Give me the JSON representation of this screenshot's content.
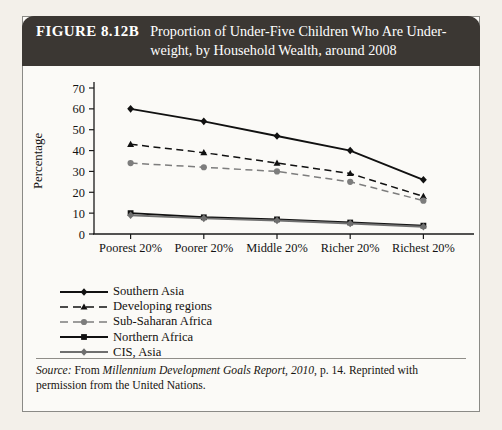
{
  "figure": {
    "number_label": "FIGURE 8.12B",
    "title_line1": "Proportion of Under-Five Children Who Are Under-",
    "title_line2": "weight, by Household Wealth, around 2008"
  },
  "source": {
    "prefix": "Source:",
    "text_before_italic": " From ",
    "italic_title": "Millennium Development Goals Report, 2010",
    "text_after_italic": ", p. 14. Reprinted with permission from the United Nations."
  },
  "colors": {
    "page_background": "#f3f0ea",
    "card_background": "#fbfaf7",
    "banner": "#3b3733",
    "banner_text": "#ffffff",
    "axis": "#1a1a1a",
    "series_dark": "#111111",
    "series_gray": "#7d7d7d",
    "frame_border": "#8a8a86"
  },
  "chart_data": {
    "type": "line",
    "xlabel": "",
    "ylabel": "Percentage",
    "categories": [
      "Poorest 20%",
      "Poorer 20%",
      "Middle 20%",
      "Richer 20%",
      "Richest 20%"
    ],
    "ylim": [
      0,
      70
    ],
    "yticks": [
      0,
      10,
      20,
      30,
      40,
      50,
      60,
      70
    ],
    "ytick_labels": [
      "0",
      "10",
      "20",
      "30",
      "40",
      "50",
      "60",
      "70"
    ],
    "grid": false,
    "legend_position": "below-left",
    "series": [
      {
        "name": "Southern Asia",
        "values": [
          60,
          54,
          47,
          40,
          26
        ],
        "marker": "diamond",
        "line_style": "solid",
        "color": "#111111"
      },
      {
        "name": "Developing regions",
        "values": [
          43,
          39,
          34,
          29,
          18
        ],
        "marker": "triangle",
        "line_style": "dashed",
        "color": "#111111"
      },
      {
        "name": "Sub-Saharan Africa",
        "values": [
          34,
          32,
          30,
          25,
          16
        ],
        "marker": "circle",
        "line_style": "dashed",
        "color": "#7d7d7d"
      },
      {
        "name": "Northern Africa",
        "values": [
          10,
          8,
          7,
          5.5,
          4
        ],
        "marker": "square",
        "line_style": "solid",
        "color": "#111111"
      },
      {
        "name": "CIS, Asia",
        "values": [
          9,
          7.5,
          6.5,
          5,
          3.5
        ],
        "marker": "diamond",
        "line_style": "solid",
        "color": "#6f6f6f"
      }
    ]
  }
}
